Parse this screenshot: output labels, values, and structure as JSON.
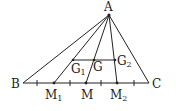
{
  "diagram": {
    "title": "",
    "points": {
      "A": {
        "label": "A",
        "x": 109,
        "y": 15
      },
      "B": {
        "label": "B",
        "x": 23,
        "y": 83
      },
      "C": {
        "label": "C",
        "x": 149,
        "y": 83
      },
      "M1": {
        "label": "M",
        "sub": "1",
        "x": 54,
        "y": 83
      },
      "M": {
        "label": "M",
        "x": 86,
        "y": 83
      },
      "M2": {
        "label": "M",
        "sub": "2",
        "x": 117,
        "y": 83
      },
      "G1": {
        "label": "G",
        "sub": "1",
        "x": 73,
        "y": 60
      },
      "G": {
        "label": "G",
        "x": 94,
        "y": 60
      },
      "G2": {
        "label": "G",
        "sub": "2",
        "x": 115,
        "y": 60
      }
    },
    "segments": [
      [
        "A",
        "B"
      ],
      [
        "A",
        "C"
      ],
      [
        "B",
        "C"
      ],
      [
        "A",
        "M1"
      ],
      [
        "A",
        "M"
      ],
      [
        "A",
        "M2"
      ],
      [
        "G1",
        "G2"
      ]
    ],
    "tick_marks_x": [
      37,
      70,
      101,
      134
    ],
    "stroke_color": "#222222"
  }
}
